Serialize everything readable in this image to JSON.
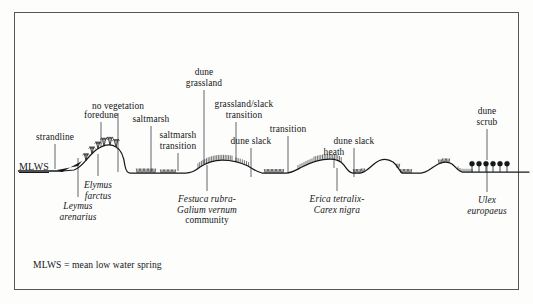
{
  "figure": {
    "type": "dune-succession-transect-profile",
    "width": 533,
    "height": 304,
    "background_color": "#fdfdfc",
    "frame_color": "#55565a",
    "ink_color": "#15171a"
  },
  "sea_level": {
    "marker_label": "MLWS",
    "underlined": true
  },
  "caption": {
    "text": "MLWS = mean low water spring"
  },
  "zone_labels": [
    {
      "id": "strandline",
      "text": "strandline",
      "x": 55,
      "y": 132,
      "leader_x": 55,
      "leader_from": 144,
      "leader_to": 169,
      "style": "roman"
    },
    {
      "id": "foredune",
      "text": "foredune",
      "x": 101,
      "y": 110,
      "leader_x": 101,
      "leader_from": 122,
      "leader_to": 147,
      "style": "roman"
    },
    {
      "id": "no-vegetation",
      "text": "no vegetation",
      "x": 118,
      "y": 101,
      "leader_x": 118,
      "leader_from": 113,
      "leader_to": 172,
      "style": "roman"
    },
    {
      "id": "saltmarsh",
      "text": "saltmarsh",
      "x": 151,
      "y": 114,
      "leader_x": 151,
      "leader_from": 126,
      "leader_to": 172,
      "style": "roman"
    },
    {
      "id": "saltmarsh-transition",
      "text": "saltmarsh\ntransition",
      "x": 178,
      "y": 130,
      "leader_x": 178,
      "leader_from": 153,
      "leader_to": 171,
      "style": "roman"
    },
    {
      "id": "dune-grassland",
      "text": "dune\ngrassland",
      "x": 204,
      "y": 67,
      "leader_x": 204,
      "leader_from": 90,
      "leader_to": 165,
      "style": "roman"
    },
    {
      "id": "grassland-slack",
      "text": "grassland/slack\ntransition",
      "x": 244,
      "y": 99,
      "leader_x": 236,
      "leader_from": 122,
      "leader_to": 162,
      "style": "roman"
    },
    {
      "id": "dune-slack",
      "text": "dune slack",
      "x": 251,
      "y": 136,
      "leader_x": 251,
      "leader_from": 148,
      "leader_to": 177,
      "style": "roman"
    },
    {
      "id": "transition",
      "text": "transition",
      "x": 288,
      "y": 124,
      "leader_x": 288,
      "leader_from": 136,
      "leader_to": 172,
      "style": "roman"
    },
    {
      "id": "heath",
      "text": "heath",
      "x": 334,
      "y": 147,
      "leader_x": 334,
      "leader_from": 158,
      "leader_to": 168,
      "style": "roman"
    },
    {
      "id": "dune-slack-2",
      "text": "dune slack",
      "x": 354,
      "y": 136,
      "leader_x": 354,
      "leader_from": 148,
      "leader_to": 177,
      "style": "roman"
    },
    {
      "id": "dune-scrub",
      "text": "dune\nscrub",
      "x": 487,
      "y": 106,
      "leader_x": 487,
      "leader_from": 129,
      "leader_to": 160,
      "style": "roman"
    }
  ],
  "species_labels": [
    {
      "id": "leymus-arenarius",
      "text": "Leymus\narenarius",
      "x": 78,
      "y": 201,
      "leader_x": 78,
      "leader_from": 158,
      "leader_to": 197,
      "style": "italic"
    },
    {
      "id": "elymus-farctus",
      "text": "Elymus\nfarctus",
      "x": 98,
      "y": 180,
      "leader_x": 98,
      "leader_from": 154,
      "leader_to": 176,
      "style": "italic"
    },
    {
      "id": "festuca-galium",
      "text": "Festuca rubra-\nGalium vernum",
      "roman_tail": "community",
      "x": 207,
      "y": 194,
      "leader_x": 207,
      "leader_from": 165,
      "leader_to": 191,
      "style": "italic-mixed"
    },
    {
      "id": "erica-carex",
      "text": "Erica tetralix-\nCarex nigra",
      "x": 337,
      "y": 194,
      "leader_x": 337,
      "leader_from": 168,
      "leader_to": 191,
      "style": "italic"
    },
    {
      "id": "ulex-europaeus",
      "text": "Ulex\neuropaeus",
      "x": 487,
      "y": 195,
      "leader_x": 487,
      "leader_from": 162,
      "leader_to": 192,
      "style": "italic"
    }
  ],
  "profile": {
    "description": "Coastal dune succession ground-surface profile from mean low water spring on the left, rising over strandline and foredune, falling to saltmarsh flat, then dune grassland ridge, dune slacks, heath, and dune scrub on the right.",
    "sea_line": {
      "x1": 18,
      "x2": 63,
      "y": 171
    },
    "path": "M 63 171 L 74 170 C 82 168 88 156 96 150 C 103 145 110 143 116 147 C 122 150 124 158 125 166 C 126 171 127 173 130 173 L 186 173 C 193 173 196 170 200 167 C 206 163 213 160 222 160 C 233 160 242 163 248 166 C 253 169 257 172 262 173 L 286 173 C 292 173 296 170 302 167 C 311 162 320 159 330 159 C 337 159 341 161 344 165 C 347 169 349 173 353 173 L 360 173 C 365 173 369 168 374 164 C 380 159 387 158 393 162 C 397 165 399 170 402 173 L 421 173 C 426 173 430 169 435 166 C 441 162 447 161 452 164 C 456 167 458 171 462 172 L 529 172"
  },
  "vegetation_groups": [
    {
      "id": "foredune-marram",
      "glyph": "grass-tufts",
      "count": 6
    },
    {
      "id": "saltmarsh-tufts",
      "glyph": "short-tufts",
      "count": 9
    },
    {
      "id": "dune-grassland-hatch",
      "glyph": "dense-hatch",
      "count": 22
    },
    {
      "id": "slack-tufts-1",
      "glyph": "short-tufts",
      "count": 5
    },
    {
      "id": "heath-hatch",
      "glyph": "dense-hatch",
      "count": 16
    },
    {
      "id": "slack-tufts-2",
      "glyph": "short-tufts",
      "count": 4
    },
    {
      "id": "slack-tufts-3",
      "glyph": "short-tufts",
      "count": 4
    },
    {
      "id": "slack-tufts-4",
      "glyph": "short-tufts",
      "count": 3
    },
    {
      "id": "dune-scrub-bushes",
      "glyph": "round-bush",
      "count": 6
    }
  ]
}
